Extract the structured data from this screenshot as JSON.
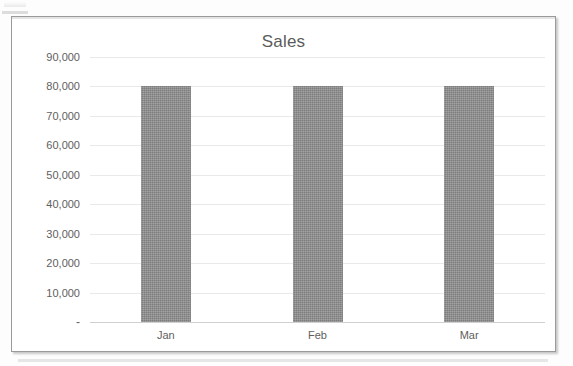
{
  "chart_data": {
    "type": "bar",
    "title": "Sales",
    "xlabel": "",
    "ylabel": "",
    "categories": [
      "Jan",
      "Feb",
      "Mar"
    ],
    "values": [
      80000,
      80000,
      80000
    ],
    "series": [
      {
        "name": "Sales",
        "values": [
          80000,
          80000,
          80000
        ]
      }
    ],
    "ylim": [
      0,
      90000
    ],
    "ytick_values": [
      0,
      10000,
      20000,
      30000,
      40000,
      50000,
      60000,
      70000,
      80000,
      90000
    ],
    "ytick_labels": [
      "-",
      "10,000",
      "20,000",
      "30,000",
      "40,000",
      "50,000",
      "60,000",
      "70,000",
      "80,000",
      "90,000"
    ],
    "grid": true,
    "legend": false,
    "legend_position": "none",
    "bar_color": "#7d7d7d",
    "gridline_color": "#e9e9e9",
    "axis_color": "#d0d0d0",
    "text_color": "#606060",
    "border_color": "#9a9a9a",
    "background": "#ffffff"
  }
}
